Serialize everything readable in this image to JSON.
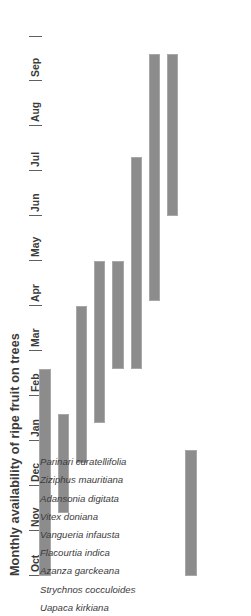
{
  "chart": {
    "title": "Monthly availability of ripe fruit on trees",
    "bar_color": "#8c8c8c",
    "bar_border_color": "#a8a8a8",
    "text_color": "#3b3b3b",
    "axis_color": "#5f5f5f"
  },
  "chart_data": {
    "type": "bar",
    "title": "Monthly availability of ripe fruit on trees",
    "xlabel": "",
    "ylabel": "",
    "orientation": "gantt-range",
    "grid": false,
    "legend": "none",
    "x_axis_position": "top",
    "categories": [
      "Uapaca kirkiana",
      "Strychnos cocculoides",
      "Azanza garckeana",
      "Flacourtia indica",
      "Vangueria infausta",
      "Vitex doniana",
      "Adansonia digitata",
      "Ziziphus mauritiana",
      "Parinari curatellifolia"
    ],
    "x_tick_labels": [
      "Oct",
      "Nov",
      "Dec",
      "Jan",
      "Feb",
      "Mar",
      "Apr",
      "May",
      "Jun",
      "Jul",
      "Aug",
      "Sep"
    ],
    "xlim": [
      0,
      12
    ],
    "ranges": [
      {
        "category": "Uapaca kirkiana",
        "start_month": "Oct",
        "end_month": "Feb",
        "start": 0.0,
        "end": 4.6
      },
      {
        "category": "Strychnos cocculoides",
        "start_month": "Nov",
        "end_month": "Jan",
        "start": 1.4,
        "end": 3.6
      },
      {
        "category": "Azanza garckeana",
        "start_month": "Dec",
        "end_month": "Apr",
        "start": 2.5,
        "end": 6.0
      },
      {
        "category": "Flacourtia indica",
        "start_month": "Jan",
        "end_month": "May",
        "start": 3.4,
        "end": 7.0
      },
      {
        "category": "Vangueria infausta",
        "start_month": "Feb",
        "end_month": "May",
        "start": 4.6,
        "end": 7.0
      },
      {
        "category": "Vitex doniana",
        "start_month": "Feb",
        "end_month": "Jul",
        "start": 4.6,
        "end": 9.3
      },
      {
        "category": "Adansonia digitata",
        "start_month": "Apr",
        "end_month": "Sep",
        "start": 6.1,
        "end": 11.6
      },
      {
        "category": "Ziziphus mauritiana",
        "start_month": "Jun",
        "end_month": "Sep",
        "start": 8.0,
        "end": 11.6
      },
      {
        "category": "Parinari curatellifolia",
        "start_month": "Oct",
        "end_month": "Dec",
        "start": 0.0,
        "end": 2.8
      }
    ]
  }
}
